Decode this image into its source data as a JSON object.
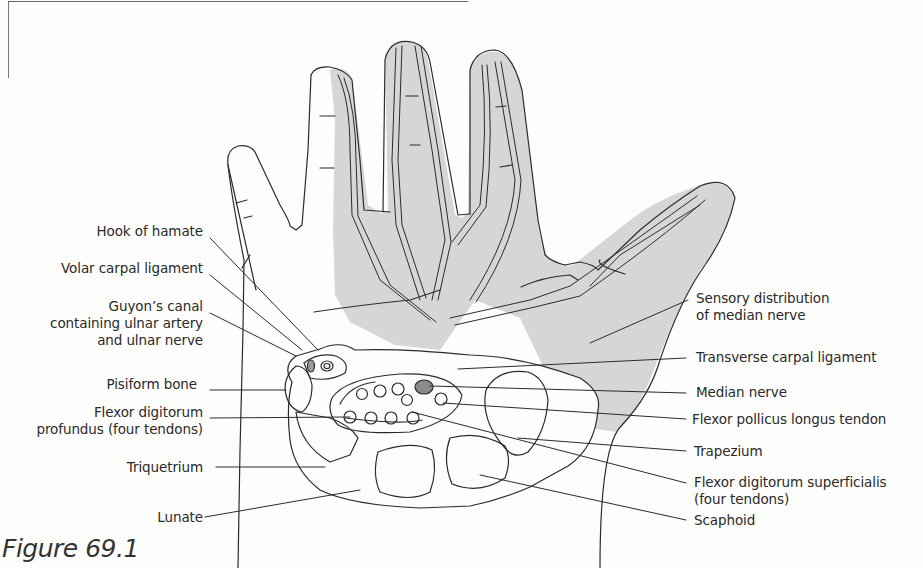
{
  "figure": {
    "caption": "Figure 69.1",
    "colors": {
      "shaded_region": "#d6d6d6",
      "outline": "#2b2b2b",
      "median_nerve_fill": "#8a8a8a",
      "background": "#fdfdfc"
    }
  },
  "labels_left": [
    {
      "id": "hook-of-hamate",
      "lines": [
        "Hook of hamate"
      ]
    },
    {
      "id": "volar-carpal-ligament",
      "lines": [
        "Volar carpal ligament"
      ]
    },
    {
      "id": "guyons-canal",
      "lines": [
        "Guyon’s canal",
        "containing ulnar artery",
        "and ulnar nerve"
      ]
    },
    {
      "id": "pisiform-bone",
      "lines": [
        "Pisiform bone"
      ]
    },
    {
      "id": "flexor-digitorum-profundus",
      "lines": [
        "Flexor digitorum",
        "profundus (four tendons)"
      ]
    },
    {
      "id": "triquetrium",
      "lines": [
        "Triquetrium"
      ]
    },
    {
      "id": "lunate",
      "lines": [
        "Lunate"
      ]
    }
  ],
  "labels_right": [
    {
      "id": "sensory-distribution",
      "lines": [
        "Sensory distribution",
        "of median nerve"
      ]
    },
    {
      "id": "transverse-carpal-ligament",
      "lines": [
        "Transverse carpal ligament"
      ]
    },
    {
      "id": "median-nerve",
      "lines": [
        "Median nerve"
      ]
    },
    {
      "id": "flexor-pollicus-longus",
      "lines": [
        "Flexor pollicus longus tendon"
      ]
    },
    {
      "id": "trapezium",
      "lines": [
        "Trapezium"
      ]
    },
    {
      "id": "flexor-digitorum-superficialis",
      "lines": [
        "Flexor digitorum superficialis",
        "(four tendons)"
      ]
    },
    {
      "id": "scaphoid",
      "lines": [
        "Scaphoid"
      ]
    }
  ]
}
